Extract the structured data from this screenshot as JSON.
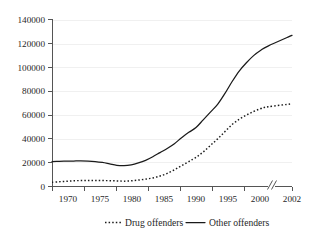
{
  "chart_data": {
    "type": "line",
    "title": "",
    "subtitle": "",
    "xlabel": "",
    "ylabel": "",
    "xlim": [
      1970,
      2002
    ],
    "ylim": [
      0,
      140000
    ],
    "grid": true,
    "axis_break": {
      "between": [
        2000,
        2002
      ],
      "symbol": "//"
    },
    "legend_position": "bottom",
    "y_ticks": [
      0,
      20000,
      40000,
      60000,
      80000,
      100000,
      120000,
      140000
    ],
    "y_tick_labels": [
      "0",
      "20000",
      "40000",
      "60000",
      "80000",
      "100000",
      "120000",
      "140000"
    ],
    "x_ticks": [
      1970,
      1975,
      1980,
      1985,
      1990,
      1995,
      2000,
      2002
    ],
    "x_tick_labels": [
      "1970",
      "1975",
      "1980",
      "1985",
      "1990",
      "1995",
      "2000",
      "2002"
    ],
    "x": [
      1970,
      1971,
      1972,
      1973,
      1974,
      1975,
      1976,
      1977,
      1978,
      1979,
      1980,
      1981,
      1982,
      1983,
      1984,
      1985,
      1986,
      1987,
      1988,
      1989,
      1990,
      1991,
      1992,
      1993,
      1994,
      1995,
      1996,
      1997,
      1998,
      1999,
      2000,
      2002
    ],
    "series": [
      {
        "name": "Drug offenders",
        "style": "dotted",
        "color": "#1a1a1a",
        "values": [
          3500,
          4000,
          4400,
          4800,
          5000,
          5100,
          5100,
          5000,
          4900,
          4700,
          4500,
          4800,
          5400,
          6200,
          7200,
          8800,
          11000,
          14000,
          17500,
          21000,
          24500,
          29000,
          34500,
          40000,
          46000,
          52000,
          56500,
          60000,
          63000,
          65500,
          67000,
          69500
        ]
      },
      {
        "name": "Other offenders",
        "style": "solid",
        "color": "#1a1a1a",
        "values": [
          21000,
          21200,
          21300,
          21400,
          21500,
          21400,
          21000,
          20200,
          19000,
          17800,
          17500,
          18200,
          19800,
          22000,
          25000,
          28500,
          32000,
          36000,
          41000,
          45500,
          49500,
          56000,
          62500,
          69000,
          78000,
          88000,
          97000,
          104000,
          110000,
          114500,
          118000,
          127000
        ]
      }
    ],
    "legend": [
      {
        "label": "Drug offenders",
        "style": "dotted"
      },
      {
        "label": "Other offenders",
        "style": "solid"
      }
    ]
  }
}
